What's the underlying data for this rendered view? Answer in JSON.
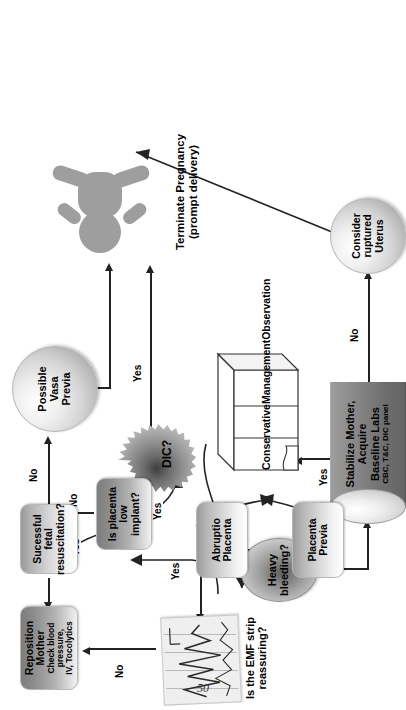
{
  "page": {
    "number": "50"
  },
  "diagram": {
    "orientation": "rotated-90-ccw",
    "colors": {
      "line": "#222222",
      "box_fill_light": "#d8d8d8",
      "box_fill_dark": "#8e8e8e",
      "sphere_fill": "#d3d3d3",
      "burst_fill": "#8f8f8f",
      "cylinder_fill": "#6f6f6f",
      "person_fill": "#9e9e9e",
      "strip_fill": "#efefef",
      "page_bg": "#ffffff"
    },
    "nodes": [
      {
        "id": "heavy-bleeding",
        "shape": "ellipse",
        "text": "Heavy\nbleeding?",
        "line1": "Heavy",
        "line2": "bleeding?"
      },
      {
        "id": "stabilize-mother",
        "shape": "cylinder",
        "title1": "Stabilize Mother,",
        "title2": "Acquire",
        "title3": "Baseline Labs",
        "subtitle": "CBC, T&C, DIC panel"
      },
      {
        "id": "dic",
        "shape": "starburst",
        "text": "DIC?"
      },
      {
        "id": "consider-ruptured-uterus",
        "shape": "sphere",
        "line1": "Consider",
        "line2": "ruptured",
        "line3": "Uterus"
      },
      {
        "id": "emf-strip",
        "shape": "image-strip",
        "caption1": "Is the EMF strip",
        "caption2": "reassuring?"
      },
      {
        "id": "reposition-mother",
        "shape": "rounded-box",
        "title": "Reposition Mother",
        "sub1": "Check blood pressure,",
        "sub2": "IV, Tocolytics"
      },
      {
        "id": "successful-fetal-resuscitation",
        "shape": "rounded-box",
        "line1": "Sucessful fetal",
        "line2": "resuscitation?"
      },
      {
        "id": "is-placenta-low-implant",
        "shape": "rounded-box",
        "line1": "Is placenta",
        "line2": "low implant?"
      },
      {
        "id": "abruptio-placenta",
        "shape": "rounded-box",
        "line1": "Abruptio",
        "line2": "Placenta"
      },
      {
        "id": "placenta-previa",
        "shape": "rounded-box",
        "line1": "Placenta",
        "line2": "Previa"
      },
      {
        "id": "conservative-management",
        "shape": "document",
        "line1": "Conservative",
        "line2": "Management",
        "line3": "Observation"
      },
      {
        "id": "possible-vasa-previa",
        "shape": "sphere",
        "line1": "Possible",
        "line2": "Vasa",
        "line3": "Previa"
      },
      {
        "id": "terminate-pregnancy",
        "shape": "person-figure",
        "caption1": "Terminate Pregnancy",
        "caption2": "(prompt delivery)"
      }
    ],
    "edges": [
      {
        "from": "heavy-bleeding",
        "to": "emf-strip",
        "label": "No"
      },
      {
        "from": "heavy-bleeding",
        "to": "stabilize-mother",
        "label": "Yes"
      },
      {
        "from": "stabilize-mother",
        "to": "dic",
        "label": "Yes"
      },
      {
        "from": "stabilize-mother",
        "to": "consider-ruptured-uterus",
        "label": "No"
      },
      {
        "from": "dic",
        "to": "emf-strip",
        "label": "No"
      },
      {
        "from": "dic",
        "to": "terminate-pregnancy",
        "label": "Yes"
      },
      {
        "from": "consider-ruptured-uterus",
        "to": "terminate-pregnancy",
        "label": ""
      },
      {
        "from": "emf-strip",
        "to": "reposition-mother",
        "label": "No"
      },
      {
        "from": "emf-strip",
        "to": "is-placenta-low-implant",
        "label": "Yes"
      },
      {
        "from": "reposition-mother",
        "to": "successful-fetal-resuscitation",
        "label": ""
      },
      {
        "from": "successful-fetal-resuscitation",
        "to": "is-placenta-low-implant",
        "label": "Yes"
      },
      {
        "from": "successful-fetal-resuscitation",
        "to": "possible-vasa-previa",
        "label": "No"
      },
      {
        "from": "is-placenta-low-implant",
        "to": "abruptio-placenta",
        "label": "No"
      },
      {
        "from": "is-placenta-low-implant",
        "to": "placenta-previa",
        "label": "Yes"
      },
      {
        "from": "abruptio-placenta",
        "to": "conservative-management",
        "label": ""
      },
      {
        "from": "placenta-previa",
        "to": "conservative-management",
        "label": ""
      },
      {
        "from": "possible-vasa-previa",
        "to": "terminate-pregnancy",
        "label": ""
      }
    ],
    "edge_labels": {
      "bleeding_no": "No",
      "bleeding_yes": "Yes",
      "stabilize_yes": "Yes",
      "stabilize_no": "No",
      "dic_no": "No",
      "dic_yes": "Yes",
      "emf_no": "No",
      "emf_yes": "Yes",
      "resus_yes": "Yes",
      "resus_no": "No",
      "placenta_no": "No",
      "placenta_yes": "Yes"
    }
  }
}
